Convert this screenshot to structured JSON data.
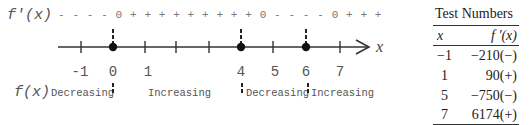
{
  "sign_chart": {
    "derivative_label": "f'(x)",
    "sign_row": "- - - - 0 + + + + + + + + + 0 - - - - 0 + + +",
    "function_label": "f(x)",
    "axis_variable": "x",
    "tick_labels": [
      "-1",
      "0",
      "1",
      "4",
      "5",
      "6",
      "7"
    ],
    "critical_points": [
      "0",
      "4",
      "6"
    ],
    "intervals": [
      {
        "label": "Decreasing",
        "range": "(-∞, 0)"
      },
      {
        "label": "Increasing",
        "range": "(0, 4)"
      },
      {
        "label": "Decreasing",
        "range": "(4, 6)"
      },
      {
        "label": "Increasing",
        "range": "(6, ∞)"
      }
    ]
  },
  "test_table": {
    "title": "Test Numbers",
    "headers": [
      "x",
      "f '(x)"
    ],
    "rows": [
      {
        "x": "−1",
        "fprime": "−210(−)"
      },
      {
        "x": "1",
        "fprime": "90(+)"
      },
      {
        "x": "5",
        "fprime": "−750(−)"
      },
      {
        "x": "7",
        "fprime": "6174(+)"
      }
    ]
  },
  "colors": {
    "line": "#222222",
    "text": "#555555",
    "signs": "#777777"
  }
}
